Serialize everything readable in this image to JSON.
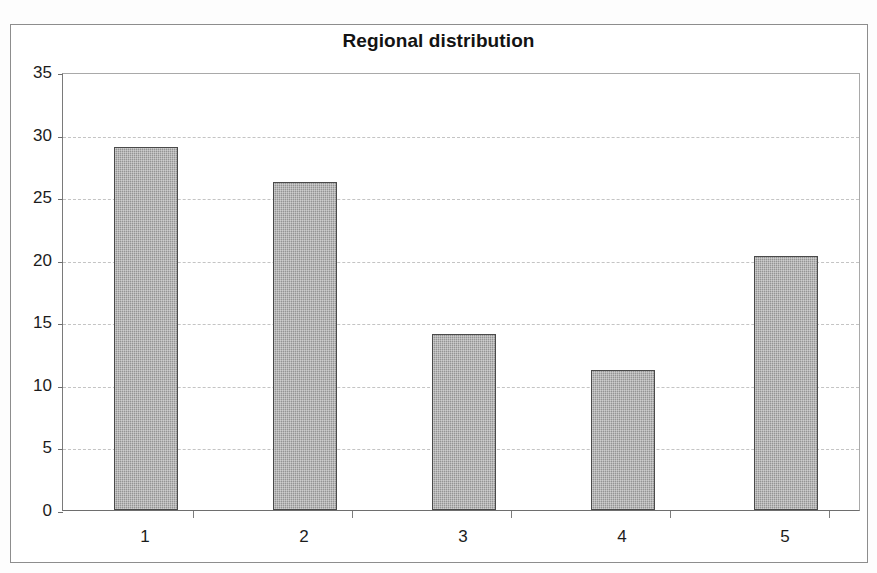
{
  "chart_data": {
    "type": "bar",
    "title": "Regional distribution",
    "xlabel": "",
    "ylabel": "",
    "categories": [
      "1",
      "2",
      "3",
      "4",
      "5"
    ],
    "values": [
      29.0,
      26.2,
      14.1,
      11.2,
      20.3
    ],
    "ylim": [
      0,
      35
    ],
    "ytick_labels": [
      "0",
      "5",
      "10",
      "15",
      "20",
      "25",
      "30",
      "35"
    ],
    "ytick_values": [
      0,
      5,
      10,
      15,
      20,
      25,
      30,
      35
    ],
    "grid": "horizontal-dashed",
    "legend": "none",
    "bar_fill_color": "#9d9d9d",
    "bar_border_color": "#4a4a4a",
    "gridline_color": "#c4c4c4",
    "axis_color": "#6e6e6e",
    "plot_background": "#ffffff",
    "title_color": "#131313"
  }
}
